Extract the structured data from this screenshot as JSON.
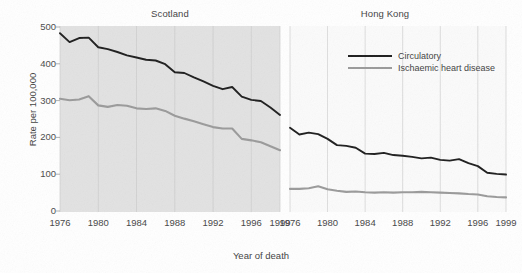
{
  "figure": {
    "xlabel": "Year of death",
    "ylabel": "Rate per 100,000",
    "ytick_labels": [
      "0",
      "100",
      "200",
      "300",
      "400",
      "500"
    ],
    "xtick_labels": [
      "1976",
      "1980",
      "1984",
      "1988",
      "1992",
      "1996",
      "1999"
    ],
    "panels": [
      {
        "title": "Scotland"
      },
      {
        "title": "Hong Kong"
      }
    ],
    "legend": [
      {
        "label": "Circulatory",
        "color": "#1d1d1d"
      },
      {
        "label": "Ischaemic heart disease",
        "color": "#9a9a9a"
      }
    ],
    "colors": {
      "circulatory": "#1d1d1d",
      "ischaemic": "#9a9a9a",
      "panel_left_bg": "#e2e2e2",
      "panel_right_bg": "#fbfbfb",
      "gridline": "#c9c9c9",
      "text": "#3f3f3f"
    }
  },
  "chart_data": [
    {
      "type": "line",
      "title": "Scotland",
      "xlabel": "Year of death",
      "ylabel": "Rate per 100,000",
      "xlim": [
        1976,
        1999
      ],
      "ylim": [
        0,
        500
      ],
      "grid": true,
      "xticks": [
        1976,
        1980,
        1984,
        1988,
        1992,
        1996,
        1999
      ],
      "yticks": [
        0,
        100,
        200,
        300,
        400,
        500
      ],
      "legend_position": "right-panel-top",
      "x": [
        1976,
        1977,
        1978,
        1979,
        1980,
        1981,
        1982,
        1983,
        1984,
        1985,
        1986,
        1987,
        1988,
        1989,
        1990,
        1991,
        1992,
        1993,
        1994,
        1995,
        1996,
        1997,
        1998,
        1999
      ],
      "series": [
        {
          "name": "Circulatory",
          "color": "#1d1d1d",
          "values": [
            483,
            459,
            470,
            471,
            445,
            440,
            432,
            423,
            417,
            411,
            409,
            399,
            377,
            375,
            363,
            352,
            340,
            331,
            337,
            311,
            302,
            299,
            281,
            261
          ]
        },
        {
          "name": "Ischaemic heart disease",
          "color": "#9a9a9a",
          "values": [
            305,
            301,
            303,
            312,
            287,
            283,
            288,
            286,
            279,
            277,
            279,
            272,
            259,
            251,
            244,
            236,
            228,
            224,
            224,
            196,
            192,
            187,
            176,
            165
          ]
        }
      ]
    },
    {
      "type": "line",
      "title": "Hong Kong",
      "xlabel": "Year of death",
      "ylabel": "Rate per 100,000",
      "xlim": [
        1976,
        1999
      ],
      "ylim": [
        0,
        500
      ],
      "grid": true,
      "xticks": [
        1976,
        1980,
        1984,
        1988,
        1992,
        1996,
        1999
      ],
      "yticks": [
        0,
        100,
        200,
        300,
        400,
        500
      ],
      "x": [
        1976,
        1977,
        1978,
        1979,
        1980,
        1981,
        1982,
        1983,
        1984,
        1985,
        1986,
        1987,
        1988,
        1989,
        1990,
        1991,
        1992,
        1993,
        1994,
        1995,
        1996,
        1997,
        1998,
        1999
      ],
      "series": [
        {
          "name": "Circulatory",
          "color": "#1d1d1d",
          "values": [
            226,
            208,
            213,
            209,
            196,
            179,
            177,
            172,
            156,
            155,
            158,
            152,
            150,
            147,
            143,
            145,
            139,
            137,
            141,
            130,
            122,
            104,
            101,
            99
          ]
        },
        {
          "name": "Ischaemic heart disease",
          "color": "#9a9a9a",
          "values": [
            60,
            60,
            62,
            67,
            59,
            55,
            52,
            53,
            51,
            50,
            51,
            50,
            51,
            51,
            52,
            51,
            50,
            49,
            48,
            46,
            45,
            40,
            38,
            37
          ]
        }
      ]
    }
  ]
}
